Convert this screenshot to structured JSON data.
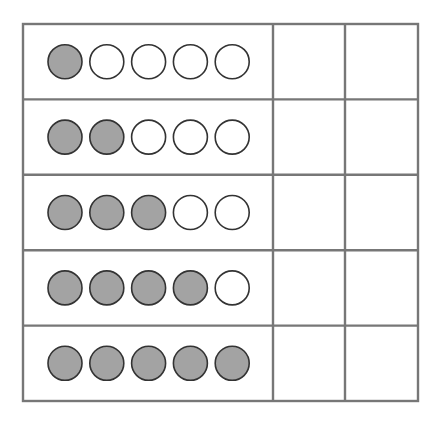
{
  "diagram": {
    "type": "ten-frame-table",
    "rows": [
      {
        "filled": 1,
        "empty": 4
      },
      {
        "filled": 2,
        "empty": 3
      },
      {
        "filled": 3,
        "empty": 2
      },
      {
        "filled": 4,
        "empty": 1
      },
      {
        "filled": 5,
        "empty": 0
      }
    ],
    "columns": 3,
    "blank_columns": 2,
    "colors": {
      "grid_line": "#777777",
      "circle_fill": "#a3a3a3",
      "circle_empty": "#ffffff",
      "circle_stroke": "#333333"
    }
  }
}
